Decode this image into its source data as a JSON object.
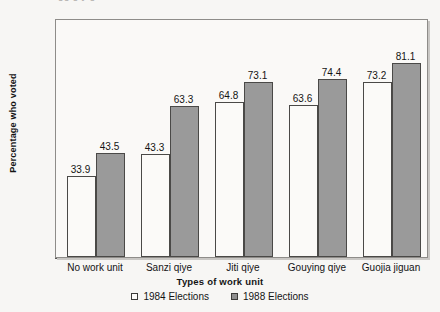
{
  "chart_data": {
    "type": "bar",
    "title": "",
    "xlabel": "Types of work unit",
    "ylabel": "Percentage who voted",
    "ylim": [
      0,
      100
    ],
    "ytick_step": 20,
    "yminor_step": 10,
    "grid": false,
    "legend_position": "bottom",
    "categories": [
      "No work unit",
      "Sanzi qiye",
      "Jiti qiye",
      "Gouying qiye",
      "Guojia jiguan"
    ],
    "yticks": [
      "0",
      "20",
      "40",
      "60",
      "80",
      "100"
    ],
    "series": [
      {
        "name": "1984 Elections",
        "color": "#fbfaf8",
        "values": [
          33.9,
          43.3,
          64.8,
          63.6,
          73.2
        ],
        "labels": [
          "33.9",
          "43.3",
          "64.8",
          "63.6",
          "73.2"
        ]
      },
      {
        "name": "1988 Elections",
        "color": "#9a9a9a",
        "values": [
          43.5,
          63.3,
          73.1,
          74.4,
          81.1
        ],
        "labels": [
          "43.5",
          "63.3",
          "73.1",
          "74.4",
          "81.1"
        ]
      }
    ]
  },
  "figure": {
    "clipped_caption": "gg g y g"
  }
}
